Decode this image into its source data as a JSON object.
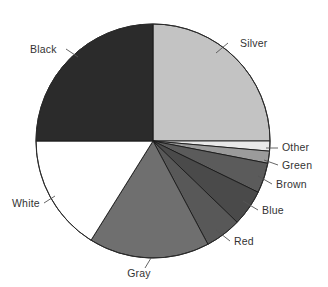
{
  "chart_data": {
    "type": "pie",
    "title": "",
    "subtitle": "",
    "xlabel": "",
    "ylabel": "",
    "legend_position": "none",
    "grid": false,
    "labels_outside": true,
    "start_angle_deg": 0,
    "direction": "clockwise",
    "categories": [
      "Silver",
      "Other",
      "Green",
      "Brown",
      "Blue",
      "Red",
      "Gray",
      "White",
      "Black"
    ],
    "values": [
      25.0,
      1.4,
      1.7,
      4.2,
      5.0,
      5.0,
      16.7,
      16.0,
      25.0
    ],
    "slices": [
      {
        "label": "Silver",
        "value": 25.0,
        "color": "#c3c3c3",
        "start_deg": 0,
        "end_deg": 90,
        "label_x": 240,
        "label_y": 47,
        "label_anchor": "start",
        "leader": [
          [
            228,
            43
          ],
          [
            216,
            53
          ]
        ]
      },
      {
        "label": "Other",
        "value": 1.4,
        "color": "#e9e9e9",
        "start_deg": 90,
        "end_deg": 95,
        "label_x": 282,
        "label_y": 151,
        "label_anchor": "start",
        "leader": [
          [
            278,
            148
          ],
          [
            266,
            148
          ]
        ]
      },
      {
        "label": "Green",
        "value": 1.7,
        "color": "#9b9b9b",
        "start_deg": 95,
        "end_deg": 101,
        "label_x": 282,
        "label_y": 169,
        "label_anchor": "start",
        "leader": [
          [
            278,
            165
          ],
          [
            264,
            160
          ]
        ]
      },
      {
        "label": "Brown",
        "value": 4.2,
        "color": "#5b5b5b",
        "start_deg": 101,
        "end_deg": 116,
        "label_x": 276,
        "label_y": 188,
        "label_anchor": "start",
        "leader": [
          [
            272,
            184
          ],
          [
            258,
            176
          ]
        ]
      },
      {
        "label": "Blue",
        "value": 5.0,
        "color": "#4a4a4a",
        "start_deg": 116,
        "end_deg": 134,
        "label_x": 262,
        "label_y": 214,
        "label_anchor": "start",
        "leader": [
          [
            258,
            210
          ],
          [
            243,
            201
          ]
        ]
      },
      {
        "label": "Red",
        "value": 5.0,
        "color": "#585858",
        "start_deg": 134,
        "end_deg": 152,
        "label_x": 234,
        "label_y": 245,
        "label_anchor": "start",
        "leader": [
          [
            230,
            241
          ],
          [
            216,
            230
          ]
        ]
      },
      {
        "label": "Gray",
        "value": 16.7,
        "color": "#6f6f6f",
        "start_deg": 152,
        "end_deg": 212,
        "label_x": 139,
        "label_y": 277,
        "label_anchor": "middle",
        "leader": [
          [
            145,
            268
          ],
          [
            151,
            258
          ]
        ]
      },
      {
        "label": "White",
        "value": 16.0,
        "color": "#ffffff",
        "start_deg": 212,
        "end_deg": 270,
        "label_x": 12,
        "label_y": 207,
        "label_anchor": "start",
        "leader": [
          [
            44,
            203
          ],
          [
            55,
            196
          ]
        ]
      },
      {
        "label": "Black",
        "value": 25.0,
        "color": "#2b2b2b",
        "start_deg": 270,
        "end_deg": 360,
        "label_x": 30,
        "label_y": 53,
        "label_anchor": "start",
        "leader": [
          [
            66,
            49
          ],
          [
            78,
            57
          ]
        ]
      }
    ],
    "geometry": {
      "center_x": 153,
      "center_y": 141,
      "radius": 117
    }
  }
}
